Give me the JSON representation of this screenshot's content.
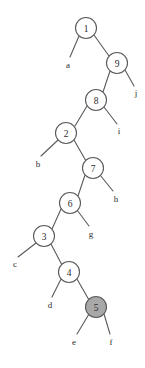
{
  "figure": {
    "kind": "binary-tree-diagram",
    "width": 145,
    "height": 368,
    "background_color": "#ffffff",
    "stroke_color": "#5a5a5a",
    "node_fill_default": "#ffffff",
    "node_fill_highlight": "#a8a8a8",
    "text_color": "#2b2b2b",
    "node_radius": 10.5,
    "leaf_marker_radius": 0
  },
  "nodes": [
    {
      "id": "n1",
      "label": "1",
      "cx": 86,
      "cy": 28,
      "shaded": false
    },
    {
      "id": "n9",
      "label": "9",
      "cx": 117,
      "cy": 63,
      "shaded": false
    },
    {
      "id": "n8",
      "label": "8",
      "cx": 96,
      "cy": 100,
      "shaded": false
    },
    {
      "id": "n2",
      "label": "2",
      "cx": 66,
      "cy": 133,
      "shaded": false
    },
    {
      "id": "n7",
      "label": "7",
      "cx": 93,
      "cy": 168,
      "shaded": false
    },
    {
      "id": "n6",
      "label": "6",
      "cx": 70,
      "cy": 203,
      "shaded": false
    },
    {
      "id": "n3",
      "label": "3",
      "cx": 44,
      "cy": 236,
      "shaded": false
    },
    {
      "id": "n4",
      "label": "4",
      "cx": 69,
      "cy": 272,
      "shaded": false
    },
    {
      "id": "n5",
      "label": "5",
      "cx": 96,
      "cy": 307,
      "shaded": true
    }
  ],
  "leaves": [
    {
      "id": "la",
      "label": "a",
      "x": 68,
      "y": 65,
      "tip_x": 70,
      "tip_y": 57,
      "parent": "n1"
    },
    {
      "id": "lj",
      "label": "j",
      "x": 136,
      "y": 93,
      "tip_x": 134,
      "tip_y": 86,
      "parent": "n9"
    },
    {
      "id": "li",
      "label": "i",
      "x": 119,
      "y": 131,
      "tip_x": 117,
      "tip_y": 124,
      "parent": "n8"
    },
    {
      "id": "lb",
      "label": "b",
      "x": 38,
      "y": 164,
      "tip_x": 41,
      "tip_y": 156,
      "parent": "n2"
    },
    {
      "id": "lh",
      "label": "h",
      "x": 116,
      "y": 199,
      "tip_x": 113,
      "tip_y": 191,
      "parent": "n7"
    },
    {
      "id": "lg",
      "label": "g",
      "x": 91,
      "y": 234,
      "tip_x": 89,
      "tip_y": 226,
      "parent": "n6"
    },
    {
      "id": "lc",
      "label": "c",
      "x": 15,
      "y": 264,
      "tip_x": 18,
      "tip_y": 257,
      "parent": "n3"
    },
    {
      "id": "ld",
      "label": "d",
      "x": 50,
      "y": 305,
      "tip_x": 52,
      "tip_y": 297,
      "parent": "n4"
    },
    {
      "id": "le",
      "label": "e",
      "x": 74,
      "y": 342,
      "tip_x": 77,
      "tip_y": 334,
      "parent": "n5"
    },
    {
      "id": "lf",
      "label": "f",
      "x": 111,
      "y": 342,
      "tip_x": 110,
      "tip_y": 334,
      "parent": "n5"
    }
  ],
  "edges": [
    {
      "id": "e-n1-a",
      "from": "n1",
      "to": "la",
      "x1": 79,
      "y1": 36,
      "x2": 70,
      "y2": 57
    },
    {
      "id": "e-n1-n9",
      "from": "n1",
      "to": "n9",
      "x1": 94,
      "y1": 35,
      "x2": 109,
      "y2": 56
    },
    {
      "id": "e-n9-n8",
      "from": "n9",
      "to": "n8",
      "x1": 110,
      "y1": 71,
      "x2": 103,
      "y2": 92
    },
    {
      "id": "e-n9-j",
      "from": "n9",
      "to": "lj",
      "x1": 125,
      "y1": 70,
      "x2": 134,
      "y2": 86
    },
    {
      "id": "e-n8-n2",
      "from": "n8",
      "to": "n2",
      "x1": 87,
      "y1": 106,
      "x2": 75,
      "y2": 126
    },
    {
      "id": "e-n8-i",
      "from": "n8",
      "to": "li",
      "x1": 104,
      "y1": 107,
      "x2": 117,
      "y2": 124
    },
    {
      "id": "e-n2-b",
      "from": "n2",
      "to": "lb",
      "x1": 58,
      "y1": 140,
      "x2": 41,
      "y2": 156
    },
    {
      "id": "e-n2-n7",
      "from": "n2",
      "to": "n7",
      "x1": 74,
      "y1": 140,
      "x2": 86,
      "y2": 161
    },
    {
      "id": "e-n7-n6",
      "from": "n7",
      "to": "n6",
      "x1": 85,
      "y1": 175,
      "x2": 78,
      "y2": 196
    },
    {
      "id": "e-n7-h",
      "from": "n7",
      "to": "lh",
      "x1": 100,
      "y1": 175,
      "x2": 113,
      "y2": 191
    },
    {
      "id": "e-n6-n3",
      "from": "n6",
      "to": "n3",
      "x1": 61,
      "y1": 209,
      "x2": 52,
      "y2": 229
    },
    {
      "id": "e-n6-g",
      "from": "n6",
      "to": "lg",
      "x1": 77,
      "y1": 210,
      "x2": 89,
      "y2": 226
    },
    {
      "id": "e-n3-c",
      "from": "n3",
      "to": "lc",
      "x1": 36,
      "y1": 243,
      "x2": 18,
      "y2": 257
    },
    {
      "id": "e-n3-n4",
      "from": "n3",
      "to": "n4",
      "x1": 51,
      "y1": 244,
      "x2": 62,
      "y2": 265
    },
    {
      "id": "e-n4-d",
      "from": "n4",
      "to": "ld",
      "x1": 61,
      "y1": 279,
      "x2": 52,
      "y2": 297
    },
    {
      "id": "e-n4-n5",
      "from": "n4",
      "to": "n5",
      "x1": 77,
      "y1": 279,
      "x2": 89,
      "y2": 300
    },
    {
      "id": "e-n5-e",
      "from": "n5",
      "to": "le",
      "x1": 89,
      "y1": 314,
      "x2": 77,
      "y2": 334
    },
    {
      "id": "e-n5-f",
      "from": "n5",
      "to": "lf",
      "x1": 104,
      "y1": 314,
      "x2": 110,
      "y2": 334
    }
  ]
}
